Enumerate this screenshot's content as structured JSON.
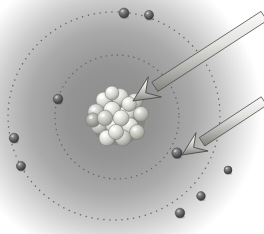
{
  "figure": {
    "kind": "atomic-model-illustration",
    "width": 264,
    "height": 234,
    "background_color": "#ffffff",
    "cloud_center_color": "#8a8a8a",
    "cloud_edge_color": "#ffffff"
  },
  "electron_cloud": {
    "name": "electron-cloud-halo",
    "center": {
      "x": 112,
      "y": 112
    },
    "radius": 150,
    "stops": [
      {
        "offset": 0.0,
        "color": "#8c8c8c"
      },
      {
        "offset": 0.3,
        "color": "#949494"
      },
      {
        "offset": 0.55,
        "color": "#aaaaaa"
      },
      {
        "offset": 0.75,
        "color": "#cccccc"
      },
      {
        "offset": 0.9,
        "color": "#ebebeb"
      },
      {
        "offset": 1.0,
        "color": "#ffffff"
      }
    ]
  },
  "orbits": [
    {
      "label": "inner-orbit",
      "center": {
        "x": 117,
        "y": 117
      },
      "radius_x": 62,
      "radius_y": 62,
      "rotation": 0,
      "style": "dotted",
      "dot_color": "#55555a",
      "dot_size": 1.4,
      "dot_gap": 4.0
    },
    {
      "label": "outer-orbit",
      "center": {
        "x": 114,
        "y": 116
      },
      "radius_x": 106,
      "radius_y": 104,
      "rotation": -6,
      "style": "dotted",
      "dot_color": "#55555a",
      "dot_size": 1.5,
      "dot_gap": 4.4
    }
  ],
  "nucleus": {
    "label": "nucleus",
    "description": "Cluster of protons and neutrons drawn as shaded spheres",
    "center": {
      "x": 118,
      "y": 118
    },
    "cluster_radius": 25,
    "particle_count": 19,
    "particle_radius": 8.2,
    "highlight_color": "#f2f2f0",
    "mid_color": "#c9c9c5",
    "shadow_color": "#74746f",
    "particles": [
      {
        "x": 104,
        "y": 100,
        "r": 8.0,
        "shade": "light"
      },
      {
        "x": 120,
        "y": 97,
        "r": 8.4,
        "shade": "light"
      },
      {
        "x": 135,
        "y": 101,
        "r": 7.8,
        "shade": "mid"
      },
      {
        "x": 96,
        "y": 112,
        "r": 8.2,
        "shade": "mid"
      },
      {
        "x": 112,
        "y": 110,
        "r": 8.6,
        "shade": "light"
      },
      {
        "x": 128,
        "y": 112,
        "r": 8.3,
        "shade": "light"
      },
      {
        "x": 141,
        "y": 114,
        "r": 7.6,
        "shade": "mid"
      },
      {
        "x": 99,
        "y": 126,
        "r": 8.0,
        "shade": "mid"
      },
      {
        "x": 114,
        "y": 125,
        "r": 8.5,
        "shade": "light"
      },
      {
        "x": 130,
        "y": 126,
        "r": 8.2,
        "shade": "light"
      },
      {
        "x": 107,
        "y": 138,
        "r": 8.0,
        "shade": "light"
      },
      {
        "x": 123,
        "y": 138,
        "r": 8.1,
        "shade": "mid"
      },
      {
        "x": 137,
        "y": 132,
        "r": 7.5,
        "shade": "mid"
      },
      {
        "x": 93,
        "y": 120,
        "r": 7.2,
        "shade": "shadow"
      },
      {
        "x": 112,
        "y": 93,
        "r": 7.0,
        "shade": "light"
      },
      {
        "x": 129,
        "y": 104,
        "r": 7.4,
        "shade": "light"
      },
      {
        "x": 105,
        "y": 118,
        "r": 7.8,
        "shade": "mid"
      },
      {
        "x": 121,
        "y": 118,
        "r": 8.0,
        "shade": "light"
      },
      {
        "x": 116,
        "y": 132,
        "r": 7.6,
        "shade": "light"
      }
    ]
  },
  "electrons": [
    {
      "label": "electron-top-inner",
      "x": 124,
      "y": 13,
      "r": 5.0,
      "orbit": "outer"
    },
    {
      "label": "electron-top-right",
      "x": 149,
      "y": 15,
      "r": 4.6,
      "orbit": "outer"
    },
    {
      "label": "electron-left-inner",
      "x": 58,
      "y": 99,
      "r": 4.8,
      "orbit": "inner"
    },
    {
      "label": "electron-left-upper",
      "x": 14,
      "y": 138,
      "r": 4.8,
      "orbit": "outer"
    },
    {
      "label": "electron-left-lower",
      "x": 21,
      "y": 166,
      "r": 4.6,
      "orbit": "outer"
    },
    {
      "label": "electron-target",
      "x": 177,
      "y": 153,
      "r": 5.2,
      "orbit": "inner"
    },
    {
      "label": "electron-bottom-right",
      "x": 201,
      "y": 196,
      "r": 4.4,
      "orbit": "outer"
    },
    {
      "label": "electron-bottom",
      "x": 180,
      "y": 213,
      "r": 4.8,
      "orbit": "outer"
    },
    {
      "label": "electron-bottom-far",
      "x": 228,
      "y": 170,
      "r": 4.0,
      "orbit": "outer"
    }
  ],
  "arrows": [
    {
      "label": "arrow-to-nucleus",
      "points_at": "nucleus",
      "tip": {
        "x": 133,
        "y": 101
      },
      "tail": {
        "x": 264,
        "y": 16
      },
      "shaft_width": 11,
      "head_length": 26,
      "head_width": 24,
      "fill_light": "#f4f4f2",
      "fill_dark": "#8d8d8a",
      "outline_color": "#4a4a4a"
    },
    {
      "label": "arrow-to-electron",
      "points_at": "electron-target",
      "tip": {
        "x": 182,
        "y": 155
      },
      "tail": {
        "x": 264,
        "y": 101
      },
      "shaft_width": 10,
      "head_length": 24,
      "head_width": 22,
      "fill_light": "#f4f4f2",
      "fill_dark": "#8d8d8a",
      "outline_color": "#4a4a4a"
    }
  ]
}
